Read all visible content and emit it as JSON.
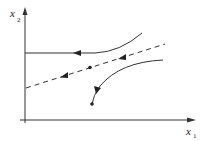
{
  "diagram": {
    "type": "phase-portrait",
    "axes": {
      "x_label": "x",
      "x_subscript": "1",
      "y_label": "x",
      "y_subscript": "2"
    },
    "elements": [
      {
        "name": "upper-trajectory",
        "style": "solid",
        "direction": "leftward"
      },
      {
        "name": "dashed-separatrix",
        "style": "dashed",
        "direction": "leftward",
        "has_point": true
      },
      {
        "name": "lower-trajectory",
        "style": "solid",
        "direction": "toward-endpoint",
        "has_endpoint": true
      }
    ],
    "colors": {
      "line": "#333333",
      "background": "#ffffff"
    }
  }
}
